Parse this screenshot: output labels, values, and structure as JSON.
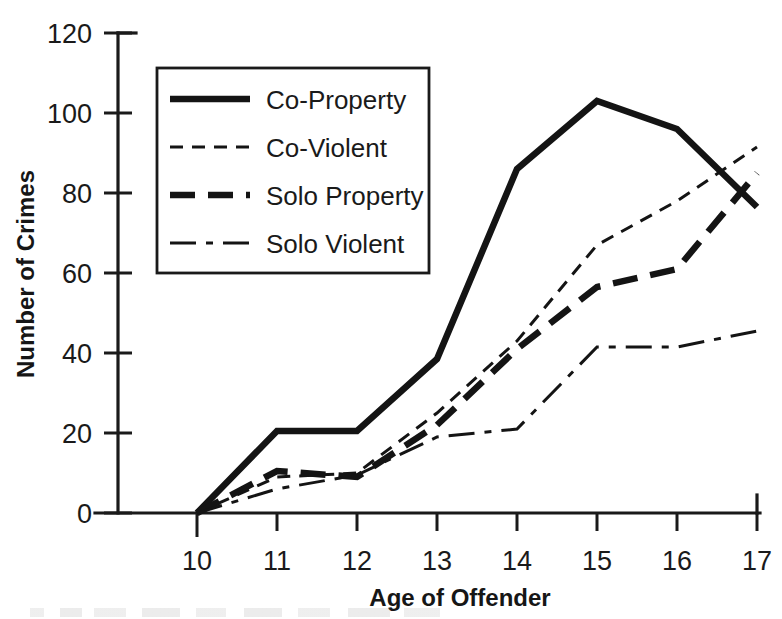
{
  "chart_data": {
    "type": "line",
    "title": "",
    "xlabel": "Age of Offender",
    "ylabel": "Number of Crimes",
    "x": [
      10,
      11,
      12,
      13,
      14,
      15,
      16,
      17
    ],
    "xticklabels": [
      "10",
      "11",
      "12",
      "13",
      "14",
      "15",
      "16",
      "17"
    ],
    "yticklabels": [
      "0",
      "20",
      "40",
      "60",
      "80",
      "100",
      "120"
    ],
    "yticks": [
      0,
      20,
      40,
      60,
      80,
      100,
      120
    ],
    "xlim": [
      10,
      17
    ],
    "ylim": [
      0,
      120
    ],
    "grid": false,
    "legend_position": "upper left inside",
    "series": [
      {
        "name": "Co-Property",
        "style": "solid-thick",
        "values": [
          0,
          20.5,
          20.5,
          38.5,
          86,
          103,
          96,
          76.5
        ]
      },
      {
        "name": "Co-Violent",
        "style": "dashed-thin",
        "values": [
          0,
          9,
          10,
          25,
          43,
          67,
          78,
          91.5
        ]
      },
      {
        "name": "Solo Property",
        "style": "dashed-thick",
        "values": [
          0,
          10.5,
          9,
          22,
          41,
          56.5,
          61,
          85
        ]
      },
      {
        "name": "Solo Violent",
        "style": "dashdot-thin",
        "values": [
          0,
          6,
          9.5,
          19,
          21,
          41.5,
          41.5,
          45.5
        ]
      }
    ]
  },
  "axes": {
    "y_title": "Number of Crimes",
    "x_title": "Age of Offender"
  },
  "legend": {
    "items": [
      {
        "label": "Co-Property"
      },
      {
        "label": "Co-Violent"
      },
      {
        "label": "Solo Property"
      },
      {
        "label": "Solo Violent"
      }
    ]
  },
  "colors": {
    "ink": "#1a1a1a",
    "background": "#ffffff"
  }
}
